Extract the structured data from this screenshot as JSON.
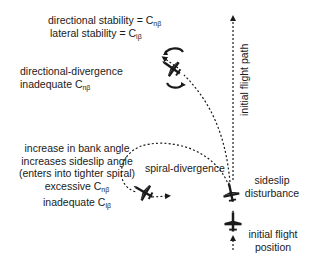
{
  "legend": {
    "line1_prefix": "directional stability = C",
    "line1_sub": "nβ",
    "line2_prefix": "lateral stability = C",
    "line2_sub": "lβ"
  },
  "labels": {
    "directional_divergence": {
      "title": "directional-divergence",
      "line2_prefix": "inadequate C",
      "line2_sub": "nβ"
    },
    "spiral_divergence": "spiral-divergence",
    "spiral_explanation": {
      "line1": "increase in bank angle",
      "line2": "increases sideslip angle",
      "line3": "(enters into tighter spiral)",
      "line4_prefix": "excessive C",
      "line4_sub": "nβ",
      "line5_prefix": "inadequate C",
      "line5_sub": "lβ"
    },
    "initial_flight_path": "initial flight path",
    "sideslip_disturbance": {
      "line1": "sideslip",
      "line2": "disturbance"
    },
    "initial_flight_position": {
      "line1": "initial flight",
      "line2": "position"
    }
  },
  "colors": {
    "ink": "#1a1a1a",
    "background": "#ffffff"
  }
}
